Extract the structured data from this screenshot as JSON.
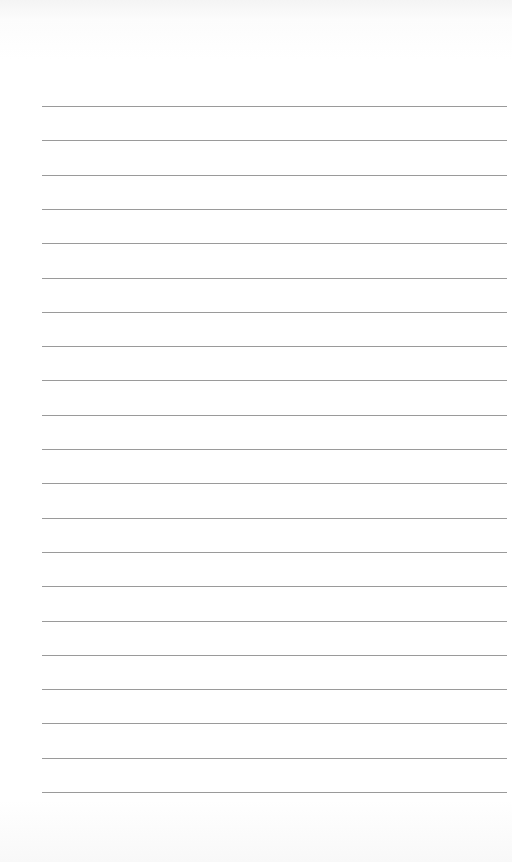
{
  "page": {
    "type": "lined-paper",
    "line_count": 21,
    "line_color": "#9a9a9a",
    "first_line_y": 106,
    "line_spacing": 34.3,
    "line_left": 42,
    "line_width": 465
  }
}
